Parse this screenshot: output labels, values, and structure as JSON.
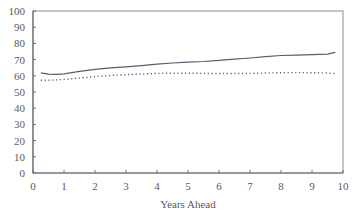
{
  "chart_data": {
    "type": "line",
    "title": "",
    "xlabel": "Years Ahead",
    "ylabel": "",
    "xlim": [
      0,
      10
    ],
    "ylim": [
      0,
      100
    ],
    "xticks": [
      0,
      1,
      2,
      3,
      4,
      5,
      6,
      7,
      8,
      9,
      10
    ],
    "yticks": [
      0,
      10,
      20,
      30,
      40,
      50,
      60,
      70,
      80,
      90,
      100
    ],
    "grid": false,
    "legend": null,
    "x": [
      0.25,
      0.5,
      0.75,
      1,
      1.5,
      2,
      2.5,
      3,
      3.5,
      4,
      4.5,
      5,
      5.5,
      6,
      6.5,
      7,
      7.5,
      8,
      8.5,
      9,
      9.5,
      9.75
    ],
    "series": [
      {
        "name": "solid",
        "style": "solid",
        "color": "#5a5e6e",
        "values": [
          61.8,
          61.0,
          60.9,
          61.2,
          62.8,
          64.0,
          64.9,
          65.5,
          66.3,
          67.2,
          67.9,
          68.4,
          68.8,
          69.5,
          70.3,
          71.0,
          71.8,
          72.5,
          72.8,
          73.0,
          73.4,
          74.5
        ]
      },
      {
        "name": "dotted",
        "style": "dotted",
        "color": "#5a5e6e",
        "values": [
          57.2,
          57.3,
          57.5,
          57.8,
          58.6,
          59.5,
          60.2,
          60.7,
          61.1,
          61.5,
          61.6,
          61.6,
          61.5,
          61.4,
          61.4,
          61.5,
          61.7,
          61.9,
          62.0,
          61.9,
          61.7,
          61.4
        ]
      }
    ]
  },
  "colors": {
    "axis": "#6a6e7c",
    "frame": "#8a8e98",
    "text": "#555a66"
  }
}
